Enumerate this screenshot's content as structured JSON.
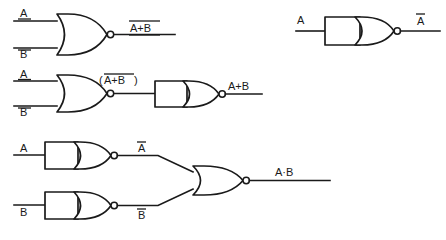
{
  "figure": {
    "background_color": "#ffffff",
    "line_color": "#1a1a1a",
    "width": 446,
    "height": 240
  },
  "circuits": [
    {
      "id": "circuit-nor",
      "description": "Two-input NOR gate",
      "inputs": [
        {
          "name": "input-a",
          "label": "A"
        },
        {
          "name": "input-b",
          "label": "B"
        }
      ],
      "gates": [
        {
          "name": "nor-gate",
          "type": "nor",
          "inputs": 2,
          "inverted": true
        }
      ],
      "output": {
        "name": "output-nor",
        "label": "A+B",
        "overbar": true
      }
    },
    {
      "id": "circuit-inverter",
      "description": "Single input NOR used as inverter",
      "inputs": [
        {
          "name": "input-a",
          "label": "A"
        }
      ],
      "gates": [
        {
          "name": "inverter-gate",
          "type": "nor",
          "inputs": 1,
          "inverted": true
        }
      ],
      "output": {
        "name": "output-not-a",
        "label": "A",
        "overbar": true
      }
    },
    {
      "id": "circuit-or",
      "description": "NOR gate followed by inverter gives OR",
      "inputs": [
        {
          "name": "input-a",
          "label": "A"
        },
        {
          "name": "input-b",
          "label": "B"
        }
      ],
      "gates": [
        {
          "name": "nor-gate",
          "type": "nor",
          "inputs": 2,
          "inverted": true
        },
        {
          "name": "inverter-gate",
          "type": "nor",
          "inputs": 1,
          "inverted": true
        }
      ],
      "intermediate": {
        "name": "label-nor-output",
        "label_prefix": "(",
        "label_core": "A+B",
        "label_suffix": ")",
        "overbar": true
      },
      "output": {
        "name": "output-or",
        "label": "A+B",
        "overbar": false
      }
    },
    {
      "id": "circuit-and",
      "description": "Two inverters feeding a NOR gate gives AND",
      "inputs": [
        {
          "name": "input-a",
          "label": "A"
        },
        {
          "name": "input-b",
          "label": "B"
        }
      ],
      "gates": [
        {
          "name": "inverter-gate-a",
          "type": "nor",
          "inputs": 1,
          "inverted": true
        },
        {
          "name": "inverter-gate-b",
          "type": "nor",
          "inputs": 1,
          "inverted": true
        },
        {
          "name": "nor-gate-final",
          "type": "nor",
          "inputs": 2,
          "inverted": true
        }
      ],
      "intermediates": [
        {
          "name": "label-not-a",
          "label": "A",
          "overbar": true
        },
        {
          "name": "label-not-b",
          "label": "B",
          "overbar": true
        }
      ],
      "output": {
        "name": "output-and",
        "label": "A·B",
        "overbar": false
      }
    }
  ]
}
